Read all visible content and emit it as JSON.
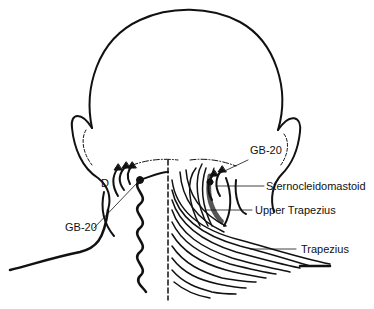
{
  "diagram": {
    "labels": {
      "gb20_right": "GB-20",
      "gb20_left": "GB-20",
      "d_marker": "D",
      "sternocleidomastoid": "Sternocleidomastoid",
      "upper_trapezius": "Upper Trapezius",
      "trapezius": "Trapezius"
    },
    "colors": {
      "ink": "#111111",
      "background": "#ffffff"
    }
  }
}
